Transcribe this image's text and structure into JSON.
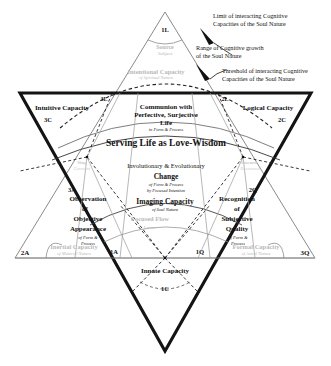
{
  "figure": {
    "kind": "hexagram-diagram",
    "title_text": "Serving Life as Love-Wisdom"
  },
  "annotations": {
    "limit": "Limit of interacting Cognitive\nCapacities of the Soul Nature",
    "range": "Range of Cognitive growth\nof the Soul Nature",
    "threshold": "Threshold of interacting Cognitive\nCapacities of the Soul Nature"
  },
  "apex": {
    "code": "1L",
    "source_line1": "Source",
    "source_line2": "Subject",
    "intentional_line1": "Intentional Capacity",
    "intentional_line2": "of Spiritual Nature"
  },
  "codes": {
    "top_apex": "1L",
    "upper_left": "3L",
    "upper_right": "2L",
    "left_c": "3C",
    "right_c": "2C",
    "left_a": "3A",
    "right_q": "2Q",
    "far_left_a": "2A",
    "far_right_q": "3Q",
    "lower_left_a": "1A",
    "lower_right_q": "1Q",
    "bottom_c": "1C"
  },
  "regions": {
    "intuitive": {
      "name": "Intuitive Capacity",
      "code": "3C"
    },
    "logical": {
      "name": "Logical Capacity",
      "code": "2C"
    },
    "communion": {
      "line1": "Communion with",
      "line2": "Perfective, Surjective",
      "line3": "Life",
      "sub": "in Form & Process"
    },
    "center_band": "Serving Life as Love-Wisdom",
    "change": {
      "line1": "Involutionary & Evolutionary",
      "line2": "Change",
      "sub1": "of Form & Process",
      "sub2": "by Focused Intention"
    },
    "imaging": {
      "name": "Imaging Capacity",
      "sub": "of Soul Nature"
    },
    "observation": {
      "line1": "Observation",
      "line2": "of",
      "line3": "Objective",
      "line4": "Appearance",
      "sub1": "of Form &",
      "sub2": "Process"
    },
    "recognition": {
      "line1": "Recognition",
      "line2": "of",
      "line3": "Subjective",
      "line4": "Quality",
      "sub1": "of Form &",
      "sub2": "Process"
    },
    "innate": {
      "name": "Innate Capacity",
      "code": "1C"
    },
    "inertial": {
      "name": "Inertial Capacity",
      "sub": "of Material Nature"
    },
    "formal": {
      "name": "Formal Capacity",
      "sub": "of Astral Nature"
    },
    "focused_flow": {
      "line1": "Focused Flow",
      "line2": "Lower"
    },
    "ghost_left": {
      "line1": "Sing",
      "line2": "Constant"
    },
    "ghost_right": {
      "line1": "Inward",
      "line2": "Resonance"
    }
  },
  "colors": {
    "ink": "#111111",
    "thin_line": "#8a8a8a",
    "ghost_text": "#b9b9b9",
    "bold_stroke": "#141414"
  }
}
